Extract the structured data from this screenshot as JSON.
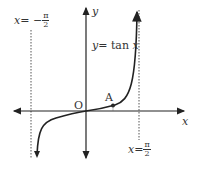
{
  "labels": {
    "y_axis": "y",
    "x_axis": "x",
    "origin": "O",
    "point": "A",
    "curve": "y = tan x",
    "curve_lhs": "y",
    "curve_eq": "= tan ",
    "curve_var": "x",
    "left_asymptote_lhs": "x",
    "left_asymptote_eq": "= −",
    "right_asymptote_lhs": "x",
    "right_asymptote_eq": "=",
    "pi": "π",
    "two": "2"
  },
  "asymptotes": [
    "x = -π/2",
    "x = π/2"
  ],
  "colors": {
    "curve": "#222222",
    "axis": "#222222",
    "asymptote": "#555555"
  }
}
